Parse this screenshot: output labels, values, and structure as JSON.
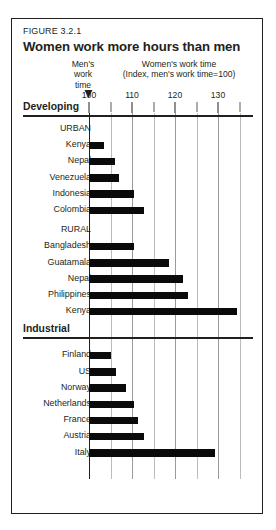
{
  "figure": {
    "number": "FIGURE 3.2.1",
    "title": "Women work more hours than men",
    "mens_caption": "Men's\nwork\ntime",
    "womens_caption_line1": "Women's work time",
    "womens_caption_line2": "(Index, men's work time=100)",
    "axis_origin_label": "100"
  },
  "chart_data": {
    "type": "bar",
    "orientation": "horizontal",
    "title": "Women work more hours than men",
    "subtitle": "FIGURE 3.2.1",
    "xlabel": "Women's work time (Index, men's work time=100)",
    "ylabel": "",
    "xlim": [
      100,
      135
    ],
    "tick_labels": [
      "100",
      "110",
      "120",
      "130"
    ],
    "tick_values": [
      100,
      110,
      120,
      130
    ],
    "minor_tick_step": 5,
    "grid": true,
    "legend": null,
    "reference_line": 100,
    "reference_label": "Men's work time",
    "sections": [
      {
        "name": "Developing",
        "groups": [
          {
            "name": "URBAN",
            "categories": [
              "Kenya",
              "Nepal",
              "Venezuela",
              "Indonesia",
              "Colombia"
            ],
            "values": [
              103.5,
              106,
              107,
              110.5,
              112.8
            ]
          },
          {
            "name": "RURAL",
            "categories": [
              "Bangladesh",
              "Guatamala",
              "Nepal",
              "Philippines",
              "Kenya"
            ],
            "values": [
              110.5,
              118.6,
              121.9,
              123,
              134.4
            ]
          }
        ]
      },
      {
        "name": "Industrial",
        "groups": [
          {
            "name": "",
            "categories": [
              "Finland",
              "US",
              "Norway",
              "Netherlands",
              "France",
              "Austria",
              "Italy"
            ],
            "values": [
              105,
              106.2,
              108.6,
              110.4,
              111.4,
              112.8,
              129.3
            ]
          }
        ]
      }
    ]
  },
  "colors": {
    "bar": "#0a0a0a",
    "frame": "#231f20",
    "grid": "#bcbcbc",
    "background": "#ffffff"
  }
}
